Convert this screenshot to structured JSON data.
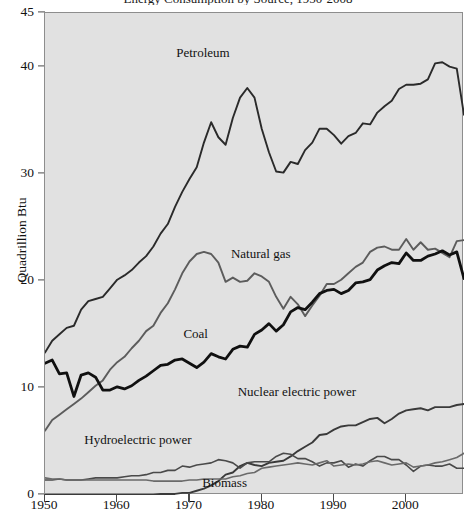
{
  "chart_data": {
    "type": "line",
    "title": "Energy Consumption by Source, 1950-2008",
    "xlabel": "",
    "ylabel": "Quadrillion Btu",
    "xlim": [
      1950,
      2008
    ],
    "ylim": [
      0,
      45
    ],
    "xticks": [
      1950,
      1960,
      1970,
      1980,
      1990,
      2000
    ],
    "xtick_labels": [
      "1950",
      "1960",
      "1970",
      "1980",
      "1990",
      "2000"
    ],
    "yticks": [
      0,
      10,
      20,
      30,
      40,
      45
    ],
    "ytick_labels": [
      "0",
      "10",
      "20",
      "30",
      "40",
      "45"
    ],
    "grid": false,
    "legend": "inline-annotations",
    "plot_background": "#e1e1e1",
    "x": [
      1950,
      1951,
      1952,
      1953,
      1954,
      1955,
      1956,
      1957,
      1958,
      1959,
      1960,
      1961,
      1962,
      1963,
      1964,
      1965,
      1966,
      1967,
      1968,
      1969,
      1970,
      1971,
      1972,
      1973,
      1974,
      1975,
      1976,
      1977,
      1978,
      1979,
      1980,
      1981,
      1982,
      1983,
      1984,
      1985,
      1986,
      1987,
      1988,
      1989,
      1990,
      1991,
      1992,
      1993,
      1994,
      1995,
      1996,
      1997,
      1998,
      1999,
      2000,
      2001,
      2002,
      2003,
      2004,
      2005,
      2006,
      2007,
      2008
    ],
    "series": [
      {
        "name": "Petroleum",
        "color": "#2a2a2a",
        "width": 1.9,
        "label_x": 1972,
        "label_y": 41.2,
        "values": [
          13.3,
          14.4,
          15.0,
          15.6,
          15.8,
          17.3,
          18.1,
          18.3,
          18.5,
          19.3,
          20.1,
          20.5,
          21.0,
          21.7,
          22.3,
          23.2,
          24.4,
          25.3,
          26.9,
          28.3,
          29.5,
          30.6,
          32.9,
          34.8,
          33.4,
          32.7,
          35.2,
          37.1,
          38.0,
          37.1,
          34.2,
          32.0,
          30.2,
          30.1,
          31.1,
          30.9,
          32.2,
          32.9,
          34.2,
          34.2,
          33.6,
          32.8,
          33.5,
          33.8,
          34.7,
          34.6,
          35.7,
          36.3,
          36.8,
          37.9,
          38.3,
          38.3,
          38.4,
          38.8,
          40.3,
          40.4,
          40.0,
          39.8,
          35.5
        ]
      },
      {
        "name": "Natural gas",
        "color": "#5c5c5c",
        "width": 1.9,
        "label_x": 1980,
        "label_y": 22.4,
        "values": [
          6.0,
          7.0,
          7.5,
          8.0,
          8.5,
          9.0,
          9.6,
          10.2,
          10.7,
          11.7,
          12.4,
          12.9,
          13.7,
          14.4,
          15.3,
          15.8,
          17.0,
          17.9,
          19.2,
          20.7,
          21.8,
          22.5,
          22.7,
          22.5,
          21.7,
          19.9,
          20.3,
          19.9,
          20.0,
          20.7,
          20.4,
          19.9,
          18.5,
          17.4,
          18.5,
          17.8,
          16.7,
          17.7,
          18.6,
          19.7,
          19.7,
          20.1,
          20.7,
          21.3,
          21.7,
          22.7,
          23.1,
          23.2,
          22.9,
          22.9,
          23.9,
          22.9,
          23.6,
          22.9,
          23.0,
          22.6,
          22.2,
          23.7,
          23.8
        ]
      },
      {
        "name": "Coal",
        "color": "#101010",
        "width": 2.8,
        "label_x": 1971,
        "label_y": 14.9,
        "values": [
          12.3,
          12.6,
          11.3,
          11.4,
          9.2,
          11.2,
          11.4,
          11.0,
          9.8,
          9.8,
          10.1,
          9.9,
          10.2,
          10.7,
          11.1,
          11.6,
          12.1,
          12.2,
          12.6,
          12.7,
          12.3,
          11.9,
          12.4,
          13.2,
          12.9,
          12.7,
          13.6,
          13.9,
          13.8,
          15.0,
          15.4,
          16.0,
          15.3,
          15.9,
          17.1,
          17.5,
          17.3,
          18.0,
          18.8,
          19.1,
          19.2,
          18.8,
          19.1,
          19.8,
          19.9,
          20.1,
          21.0,
          21.4,
          21.7,
          21.6,
          22.6,
          21.9,
          21.9,
          22.3,
          22.5,
          22.8,
          22.4,
          22.7,
          20.2
        ]
      },
      {
        "name": "Nuclear electric power",
        "color": "#3a3a3a",
        "width": 1.9,
        "label_x": 1985,
        "label_y": 9.5,
        "values": [
          0.0,
          0.0,
          0.0,
          0.0,
          0.0,
          0.0,
          0.0,
          0.0,
          0.0,
          0.0,
          0.0,
          0.0,
          0.0,
          0.0,
          0.0,
          0.0,
          0.1,
          0.1,
          0.1,
          0.2,
          0.2,
          0.4,
          0.6,
          0.9,
          1.3,
          1.9,
          2.1,
          2.7,
          3.0,
          2.8,
          2.7,
          3.0,
          3.1,
          3.2,
          3.6,
          4.1,
          4.5,
          4.9,
          5.6,
          5.7,
          6.1,
          6.4,
          6.5,
          6.5,
          6.8,
          7.1,
          7.2,
          6.7,
          7.1,
          7.6,
          7.9,
          8.0,
          8.1,
          7.9,
          8.2,
          8.2,
          8.2,
          8.4,
          8.5
        ]
      },
      {
        "name": "Hydroelectric power",
        "color": "#4a4a4a",
        "width": 1.6,
        "label_x": 1963,
        "label_y": 5.0,
        "values": [
          1.4,
          1.4,
          1.5,
          1.4,
          1.4,
          1.4,
          1.5,
          1.6,
          1.6,
          1.6,
          1.6,
          1.7,
          1.8,
          1.8,
          1.9,
          2.1,
          2.1,
          2.3,
          2.3,
          2.7,
          2.6,
          2.8,
          2.9,
          3.0,
          3.3,
          3.2,
          3.0,
          2.5,
          3.0,
          3.1,
          3.1,
          3.1,
          3.6,
          3.9,
          3.8,
          3.4,
          3.4,
          3.1,
          2.7,
          3.0,
          3.0,
          3.2,
          2.6,
          2.9,
          2.7,
          3.2,
          3.6,
          3.6,
          3.3,
          3.3,
          2.8,
          2.2,
          2.7,
          2.8,
          2.7,
          2.7,
          2.9,
          2.5,
          2.5
        ]
      },
      {
        "name": "Biomass",
        "color": "#6a6a6a",
        "width": 1.6,
        "label_x": 1975,
        "label_y": 1.0,
        "values": [
          1.6,
          1.5,
          1.5,
          1.4,
          1.4,
          1.4,
          1.4,
          1.4,
          1.4,
          1.4,
          1.4,
          1.4,
          1.4,
          1.4,
          1.4,
          1.3,
          1.3,
          1.3,
          1.3,
          1.3,
          1.4,
          1.4,
          1.5,
          1.5,
          1.5,
          1.5,
          1.7,
          1.8,
          2.0,
          2.1,
          2.5,
          2.6,
          2.7,
          2.8,
          2.9,
          3.0,
          2.9,
          2.8,
          3.0,
          3.2,
          2.7,
          2.8,
          2.9,
          2.8,
          2.9,
          3.1,
          3.2,
          3.0,
          2.8,
          2.9,
          3.0,
          2.6,
          2.7,
          2.8,
          3.0,
          3.1,
          3.3,
          3.5,
          3.9
        ]
      }
    ]
  }
}
